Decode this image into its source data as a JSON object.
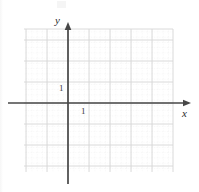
{
  "figure": {
    "kind": "coordinate-plane",
    "width": 199,
    "height": 192,
    "background_color": "#ffffff"
  },
  "axes": {
    "x_label": "x",
    "y_label": "y",
    "axis_color": "#444444",
    "origin_px": {
      "x": 68,
      "y": 103
    },
    "unit_px": 21,
    "x_axis": {
      "pixel_start": 8,
      "pixel_end": 191,
      "arrow_at": "end"
    },
    "y_axis": {
      "pixel_start": 184,
      "pixel_end": 22,
      "arrow_at": "end"
    }
  },
  "ticks": {
    "x_one_label": "1",
    "y_one_label": "1"
  },
  "grid": {
    "major_color": "#d8d8d8",
    "minor_color": "#ececec",
    "major_step_px": 21,
    "minor_per_major": 4,
    "left_px": 24,
    "right_px": 173,
    "top_px": 29,
    "bottom_px": 172,
    "major_x_lines": [
      26,
      47,
      68,
      89,
      110,
      131,
      152,
      173
    ],
    "major_y_lines": [
      29,
      40,
      61,
      82,
      103,
      124,
      145,
      166
    ],
    "x_range_units": [
      -2,
      5
    ],
    "y_range_units": [
      -3,
      4
    ]
  },
  "series": []
}
